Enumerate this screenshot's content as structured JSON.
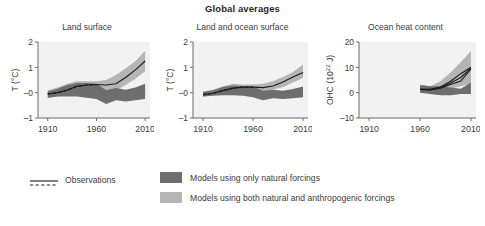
{
  "figure": {
    "title": "Global averages"
  },
  "colors": {
    "natural_band": "#6e6e6e",
    "anthropogenic_band": "#b5b5b5",
    "observation_line": "#1a1a1a",
    "axis": "#6b6b6b",
    "text": "#3c3c3c",
    "title_text": "#2b2b2b",
    "plot_background": "#f2f2f2"
  },
  "legend": {
    "observations": {
      "label": "Observations",
      "marker": "dashed-and-solid-line"
    },
    "natural": {
      "label": "Models using only natural forcings",
      "swatch": "dark-gray-band"
    },
    "anthropogenic": {
      "label": "Models using both natural and anthropogenic forcings",
      "swatch": "light-gray-band"
    }
  },
  "chart_data": [
    {
      "type": "area",
      "panel_index": 0,
      "title": "Land surface",
      "xlabel": "",
      "ylabel": "T (°C)",
      "xlim": [
        1900,
        2015
      ],
      "ylim": [
        -1,
        2
      ],
      "xticks": [
        1910,
        1960,
        2010
      ],
      "xtick_labels": [
        "1910",
        "1960",
        "2010"
      ],
      "yticks": [
        -1,
        0,
        1,
        2
      ],
      "ytick_labels": [
        "–1",
        "–0",
        "1",
        "2"
      ],
      "grid": false,
      "legend_position": "below-figure",
      "x": [
        1910,
        1920,
        1930,
        1940,
        1950,
        1960,
        1970,
        1980,
        1990,
        2000,
        2010
      ],
      "series": [
        {
          "name": "Models using both natural and anthropogenic forcings",
          "kind": "band",
          "lower": [
            -0.2,
            -0.15,
            -0.1,
            -0.05,
            -0.05,
            -0.05,
            0.0,
            0.1,
            0.3,
            0.55,
            0.85
          ],
          "upper": [
            0.1,
            0.2,
            0.35,
            0.45,
            0.45,
            0.45,
            0.5,
            0.7,
            0.95,
            1.25,
            1.65
          ]
        },
        {
          "name": "Models using only natural forcings",
          "kind": "band",
          "lower": [
            -0.2,
            -0.15,
            -0.15,
            -0.15,
            -0.2,
            -0.25,
            -0.45,
            -0.3,
            -0.35,
            -0.3,
            -0.25
          ],
          "upper": [
            0.05,
            0.15,
            0.3,
            0.38,
            0.38,
            0.35,
            0.1,
            0.18,
            0.12,
            0.2,
            0.35
          ]
        },
        {
          "name": "Observations",
          "kind": "line",
          "values": [
            -0.05,
            0.0,
            0.1,
            0.25,
            0.3,
            0.32,
            0.3,
            0.35,
            0.6,
            0.9,
            1.25
          ]
        }
      ]
    },
    {
      "type": "area",
      "panel_index": 1,
      "title": "Land and ocean surface",
      "xlabel": "",
      "ylabel": "T (°C)",
      "xlim": [
        1900,
        2015
      ],
      "ylim": [
        -1,
        2
      ],
      "xticks": [
        1910,
        1960,
        2010
      ],
      "xtick_labels": [
        "1910",
        "1960",
        "2010"
      ],
      "yticks": [
        -1,
        0,
        1,
        2
      ],
      "ytick_labels": [
        "–1",
        "–0",
        "1",
        "2"
      ],
      "grid": false,
      "legend_position": "below-figure",
      "x": [
        1910,
        1920,
        1930,
        1940,
        1950,
        1960,
        1970,
        1980,
        1990,
        2000,
        2010
      ],
      "series": [
        {
          "name": "Models using both natural and anthropogenic forcings",
          "kind": "band",
          "lower": [
            -0.15,
            -0.1,
            -0.05,
            0.0,
            0.0,
            0.0,
            0.05,
            0.12,
            0.22,
            0.4,
            0.58
          ],
          "upper": [
            0.05,
            0.12,
            0.25,
            0.35,
            0.32,
            0.32,
            0.35,
            0.45,
            0.62,
            0.82,
            1.1
          ]
        },
        {
          "name": "Models using only natural forcings",
          "kind": "band",
          "lower": [
            -0.15,
            -0.12,
            -0.1,
            -0.1,
            -0.12,
            -0.18,
            -0.3,
            -0.22,
            -0.25,
            -0.22,
            -0.18
          ],
          "upper": [
            0.03,
            0.1,
            0.22,
            0.28,
            0.26,
            0.24,
            0.08,
            0.12,
            0.08,
            0.14,
            0.24
          ]
        },
        {
          "name": "Observations",
          "kind": "line",
          "values": [
            -0.08,
            -0.02,
            0.08,
            0.18,
            0.22,
            0.22,
            0.2,
            0.26,
            0.42,
            0.62,
            0.8
          ]
        }
      ]
    },
    {
      "type": "area",
      "panel_index": 2,
      "title": "Ocean heat content",
      "xlabel": "",
      "ylabel": "OHC (10²² J)",
      "ylabel_base": "OHC (10",
      "ylabel_exponent": "22",
      "ylabel_tail": " J)",
      "xlim": [
        1900,
        2015
      ],
      "ylim": [
        -10,
        20
      ],
      "xticks": [
        1910,
        1960,
        2010
      ],
      "xtick_labels": [
        "1910",
        "1960",
        "2010"
      ],
      "yticks": [
        -10,
        0,
        10,
        20
      ],
      "ytick_labels": [
        "–10",
        "0",
        "10",
        "20"
      ],
      "grid": false,
      "legend_position": "below-figure",
      "x": [
        1960,
        1970,
        1980,
        1990,
        2000,
        2010
      ],
      "series": [
        {
          "name": "Models using both natural and anthropogenic forcings",
          "kind": "band",
          "lower": [
            0.0,
            0.0,
            0.5,
            1.5,
            2.5,
            3.5
          ],
          "upper": [
            3.0,
            2.5,
            4.5,
            8.0,
            12.0,
            16.5
          ]
        },
        {
          "name": "Models using only natural forcings",
          "kind": "band",
          "lower": [
            0.0,
            -0.5,
            -1.0,
            -1.0,
            -0.5,
            -0.5
          ],
          "upper": [
            3.0,
            2.5,
            2.5,
            2.0,
            1.5,
            4.0
          ]
        },
        {
          "name": "Observations 1",
          "kind": "line",
          "values": [
            1.3,
            1.3,
            2.2,
            4.5,
            7.5,
            10.0
          ]
        },
        {
          "name": "Observations 2",
          "kind": "line",
          "values": [
            1.3,
            1.2,
            2.0,
            3.8,
            6.0,
            9.7
          ]
        },
        {
          "name": "Observations 3",
          "kind": "line",
          "values": [
            1.3,
            1.1,
            1.8,
            3.2,
            4.6,
            9.3
          ]
        }
      ]
    }
  ]
}
